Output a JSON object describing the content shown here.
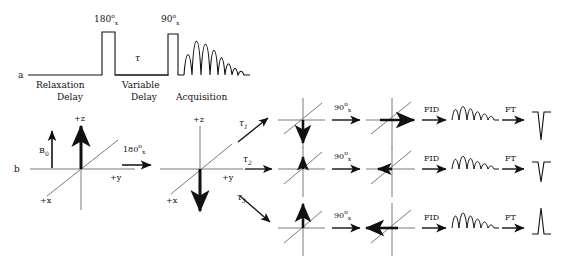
{
  "figure": {
    "background": "#ffffff",
    "ink": "#111111",
    "panels": [
      {
        "id": "a",
        "label": "a",
        "kind": "pulse-sequence"
      },
      {
        "id": "b",
        "label": "b",
        "kind": "vector-model"
      }
    ]
  },
  "panel_a": {
    "letter": "a",
    "pulses": [
      {
        "name": "inversion-pulse",
        "angle": "180",
        "degree_symbol": "o",
        "phase": "x",
        "label": "180"
      },
      {
        "name": "detection-pulse",
        "angle": "90",
        "degree_symbol": "o",
        "phase": "x",
        "label": "90"
      }
    ],
    "delay_symbol": "τ",
    "segments": [
      {
        "name": "relaxation-delay",
        "line1": "Relaxation",
        "line2": "Delay"
      },
      {
        "name": "variable-delay",
        "line1": "Variable",
        "line2": "Delay"
      },
      {
        "name": "acquisition",
        "line1": "Acquisition",
        "line2": ""
      }
    ]
  },
  "panel_b": {
    "letter": "b",
    "field_label": "B",
    "field_sub": "0",
    "axes": {
      "z": "+z",
      "y": "+y",
      "x": "+x"
    },
    "first_rotation": {
      "angle": "180",
      "degree_symbol": "o",
      "phase": "x"
    },
    "branches": [
      {
        "name": "branch-tau1",
        "tau": "τ",
        "tau_index": "1",
        "magnetization": "inverted-full",
        "pulse": {
          "angle": "90",
          "degree_symbol": "o",
          "phase": "x"
        },
        "after_pulse": "minus-y",
        "fid_label": "FID",
        "ft_label": "FT",
        "peak": "negative-large"
      },
      {
        "name": "branch-tau2",
        "tau": "τ",
        "tau_index": "2",
        "magnetization": "small-positive",
        "pulse": {
          "angle": "90",
          "degree_symbol": "o",
          "phase": "x"
        },
        "after_pulse": "small-minus-y",
        "fid_label": "FID",
        "ft_label": "FT",
        "peak": "negative-small"
      },
      {
        "name": "branch-tau3",
        "tau": "τ",
        "tau_index": "3",
        "magnetization": "recovered-positive",
        "pulse": {
          "angle": "90",
          "degree_symbol": "o",
          "phase": "x"
        },
        "after_pulse": "plus-y",
        "fid_label": "FID",
        "ft_label": "FT",
        "peak": "positive-large"
      }
    ]
  }
}
